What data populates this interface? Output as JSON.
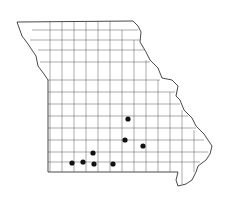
{
  "map": {
    "region": "Missouri",
    "subdivision": "counties",
    "marker_color": "#111111",
    "occurrences": [
      {
        "county": "Laclede area"
      },
      {
        "county": "Texas area"
      },
      {
        "county": "Shannon area"
      },
      {
        "county": "Stone area"
      },
      {
        "county": "Barry area"
      },
      {
        "county": "Barry/Stone area"
      },
      {
        "county": "Taney area"
      },
      {
        "county": "Ozark area"
      }
    ]
  }
}
